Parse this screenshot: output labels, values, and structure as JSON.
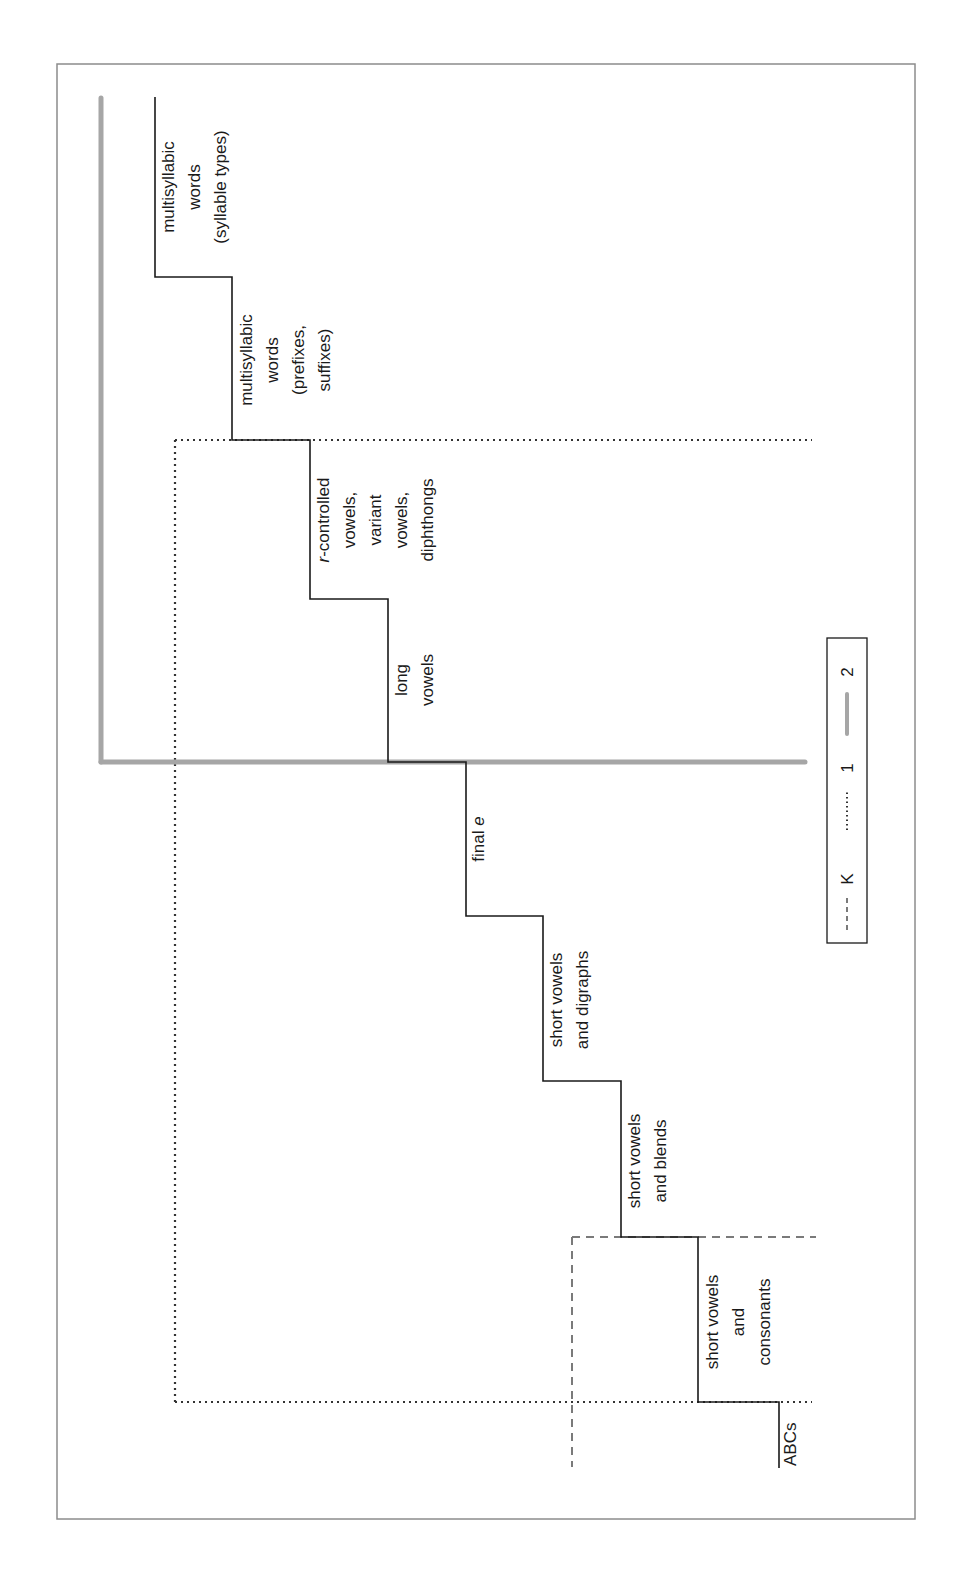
{
  "diagram": {
    "type": "staircase-progression",
    "orientation": "rotated-90-clockwise",
    "frame_color": "#8c8c8c",
    "steps": [
      {
        "id": "abcs",
        "lines": [
          "ABCs"
        ]
      },
      {
        "id": "short-vowels-consonants",
        "lines": [
          "short vowels",
          "and",
          "consonants"
        ]
      },
      {
        "id": "short-vowels-blends",
        "lines": [
          "short vowels",
          "and blends"
        ]
      },
      {
        "id": "short-vowels-digraphs",
        "lines": [
          "short vowels",
          "and digraphs"
        ]
      },
      {
        "id": "final-e",
        "lines": [
          "final e"
        ],
        "italic_part": "e"
      },
      {
        "id": "long-vowels",
        "lines": [
          "long",
          "vowels"
        ]
      },
      {
        "id": "r-controlled",
        "lines": [
          "r-controlled",
          "vowels,",
          "variant",
          "vowels,",
          "diphthongs"
        ],
        "italic_part": "r"
      },
      {
        "id": "multisyllabic-prefixes",
        "lines": [
          "multisyllabic",
          "words",
          "(prefixes,",
          "suffixes)"
        ]
      },
      {
        "id": "multisyllabic-syllable-types",
        "lines": [
          "multisyllabic",
          "words",
          "(syllable types)"
        ]
      }
    ],
    "legend": {
      "items": [
        {
          "label": "K",
          "style": "dashed",
          "color": "#7a7a7a"
        },
        {
          "label": "1",
          "style": "dotted",
          "color": "#333333"
        },
        {
          "label": "2",
          "style": "solid-thick",
          "color": "#a6a6a6"
        }
      ]
    },
    "grade_boundaries": {
      "K": {
        "style": "dashed",
        "color": "#7a7a7a"
      },
      "1": {
        "style": "dotted",
        "color": "#333333"
      },
      "2": {
        "style": "solid-thick",
        "color": "#a6a6a6"
      }
    },
    "labels": {
      "abcs": "ABCs",
      "svc_1": "short vowels",
      "svc_2": "and",
      "svc_3": "consonants",
      "svb_1": "short vowels",
      "svb_2": "and blends",
      "svd_1": "short vowels",
      "svd_2": "and digraphs",
      "fe_1": "final ",
      "fe_2": "e",
      "lv_1": "long",
      "lv_2": "vowels",
      "rc_r": "r",
      "rc_1": "-controlled",
      "rc_2": "vowels,",
      "rc_3": "variant",
      "rc_4": "vowels,",
      "rc_5": "diphthongs",
      "mp_1": "multisyllabic",
      "mp_2": "words",
      "mp_3": "(prefixes,",
      "mp_4": "suffixes)",
      "ms_1": "multisyllabic",
      "ms_2": "words",
      "ms_3": "(syllable types)",
      "legend_k": "K",
      "legend_1": "1",
      "legend_2": "2"
    }
  }
}
